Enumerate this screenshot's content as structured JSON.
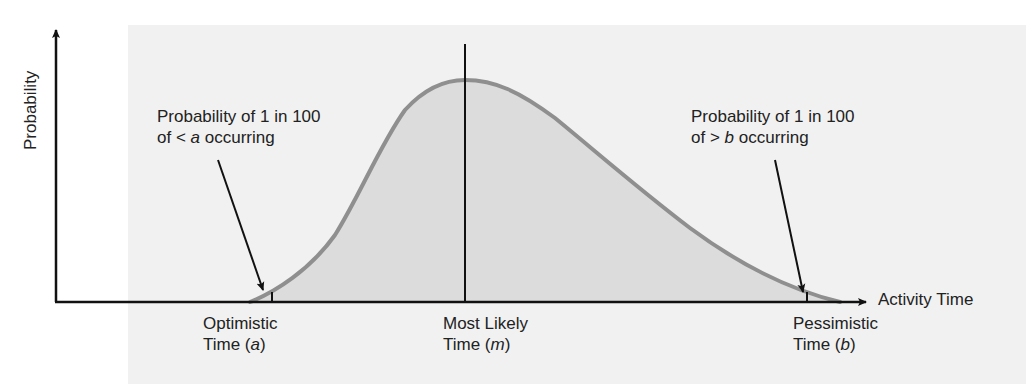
{
  "diagram": {
    "type": "beta-distribution-pert",
    "y_axis_label": "Probability",
    "x_axis_label": "Activity Time",
    "annotations": {
      "left": {
        "line1": "Probability of 1 in 100",
        "line2_prefix": "of < ",
        "line2_var": "a",
        "line2_suffix": " occurring"
      },
      "right": {
        "line1": "Probability of 1 in 100",
        "line2_prefix": "of > ",
        "line2_var": "b",
        "line2_suffix": " occurring"
      }
    },
    "x_labels": [
      {
        "line1": "Optimistic",
        "line2_prefix": "Time (",
        "var": "a",
        "line2_suffix": ")"
      },
      {
        "line1": "Most Likely",
        "line2_prefix": "Time (",
        "var": "m",
        "line2_suffix": ")"
      },
      {
        "line1": "Pessimistic",
        "line2_prefix": "Time (",
        "var": "b",
        "line2_suffix": ")"
      }
    ],
    "colors": {
      "curve": "#8f8f8f",
      "fill": "#dcdcdc",
      "panel": "#f1f1f1",
      "axis": "#111111"
    }
  }
}
